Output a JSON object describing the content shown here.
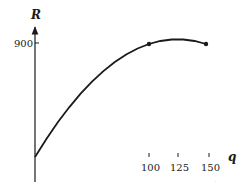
{
  "chart_data": {
    "type": "line",
    "title": "",
    "xlabel": "q",
    "ylabel": "R",
    "x_ticks": [
      100,
      125,
      150
    ],
    "x_tick_labels": [
      "100",
      "125",
      "150"
    ],
    "y_ticks": [
      900
    ],
    "y_tick_labels": [
      "900"
    ],
    "xlim": [
      0,
      165
    ],
    "ylim": [
      0,
      1020
    ],
    "grid": false,
    "legend": null,
    "series": [
      {
        "name": "R(q)",
        "function": "R = 15q - 0.06q^2",
        "x": [
          0,
          10,
          20,
          30,
          40,
          50,
          60,
          70,
          80,
          90,
          100,
          110,
          120,
          125,
          130,
          140,
          150
        ],
        "y": [
          0,
          144,
          276,
          396,
          504,
          600,
          684,
          756,
          816,
          864,
          900,
          924,
          936,
          937.5,
          936,
          924,
          900
        ]
      }
    ],
    "marked_points": [
      {
        "x": 100,
        "y": 900
      },
      {
        "x": 150,
        "y": 900
      }
    ]
  },
  "labels": {
    "y_axis": "R",
    "x_axis": "q",
    "y_tick_900": "900",
    "x_tick_100": "100",
    "x_tick_125": "125",
    "x_tick_150": "150"
  }
}
